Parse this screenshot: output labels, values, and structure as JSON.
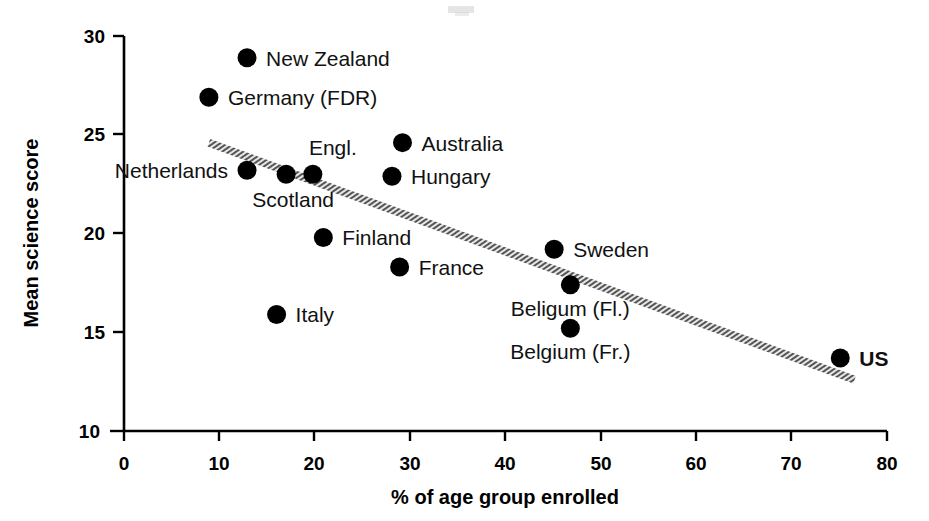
{
  "chart_data": {
    "type": "scatter",
    "title": "",
    "xlabel": "% of age group enrolled",
    "ylabel": "Mean science score",
    "xlim": [
      0,
      80
    ],
    "ylim": [
      10,
      30
    ],
    "xticks": [
      "0",
      "10",
      "20",
      "30",
      "40",
      "50",
      "60",
      "70",
      "80"
    ],
    "yticks": [
      "10",
      "15",
      "20",
      "25",
      "30"
    ],
    "grid": false,
    "legend": "none",
    "points": [
      {
        "label": "New Zealand",
        "x": 12.9,
        "y": 28.9,
        "label_side": "right",
        "bold": false
      },
      {
        "label": "Germany (FDR)",
        "x": 8.9,
        "y": 26.9,
        "label_side": "right",
        "bold": false
      },
      {
        "label": "Australia",
        "x": 29.2,
        "y": 24.6,
        "label_side": "right",
        "bold": false
      },
      {
        "label": "Netherlands",
        "x": 12.9,
        "y": 23.2,
        "label_side": "left",
        "bold": false
      },
      {
        "label": "Scotland",
        "x": 17.0,
        "y": 23.0,
        "label_side": "below-left",
        "bold": false
      },
      {
        "label": "Engl.",
        "x": 19.8,
        "y": 23.0,
        "label_side": "above",
        "bold": false
      },
      {
        "label": "Hungary",
        "x": 28.1,
        "y": 22.9,
        "label_side": "right",
        "bold": false
      },
      {
        "label": "Finland",
        "x": 20.9,
        "y": 19.8,
        "label_side": "right",
        "bold": false
      },
      {
        "label": "Sweden",
        "x": 45.1,
        "y": 19.2,
        "label_side": "right",
        "bold": false
      },
      {
        "label": "France",
        "x": 28.9,
        "y": 18.3,
        "label_side": "right",
        "bold": false
      },
      {
        "label": "Beligum (Fl.)",
        "x": 46.8,
        "y": 17.4,
        "label_side": "below",
        "bold": false
      },
      {
        "label": "Italy",
        "x": 16.0,
        "y": 15.9,
        "label_side": "right",
        "bold": false
      },
      {
        "label": "Belgium (Fr.)",
        "x": 46.8,
        "y": 15.2,
        "label_side": "below",
        "bold": false
      },
      {
        "label": "US",
        "x": 75.1,
        "y": 13.7,
        "label_side": "right",
        "bold": true
      }
    ],
    "trendline": {
      "x_start": 8.9,
      "y_start": 24.6,
      "x_end": 76.6,
      "y_end": 12.6,
      "style": "hatched-thick",
      "color": "#4a4a4a"
    }
  }
}
